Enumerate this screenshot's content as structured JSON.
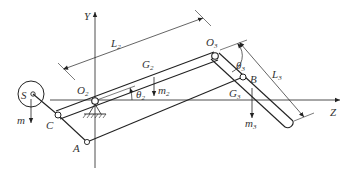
{
  "diagram": {
    "type": "mechanism-schematic",
    "axes": {
      "y_label": "Y",
      "z_label": "Z"
    },
    "points": {
      "S": "S",
      "C": "C",
      "A": "A",
      "B": "B",
      "O2": {
        "main": "O",
        "sub": "2"
      },
      "O3": {
        "main": "O",
        "sub": "3"
      }
    },
    "dimensions": {
      "L2": {
        "main": "L",
        "sub": "2"
      },
      "L3": {
        "main": "L",
        "sub": "3"
      }
    },
    "angles": {
      "theta2": {
        "main": "θ",
        "sub": "2"
      },
      "theta3": {
        "main": "θ",
        "sub": "3"
      }
    },
    "centers_of_gravity": {
      "G2": {
        "main": "G",
        "sub": "2"
      },
      "G3": {
        "main": "G",
        "sub": "3"
      }
    },
    "masses": {
      "m": "m",
      "m2": {
        "main": "m",
        "sub": "2"
      },
      "m3": {
        "main": "m",
        "sub": "3"
      }
    },
    "colors": {
      "line": "#222222",
      "text": "#333333",
      "background": "#ffffff"
    }
  }
}
